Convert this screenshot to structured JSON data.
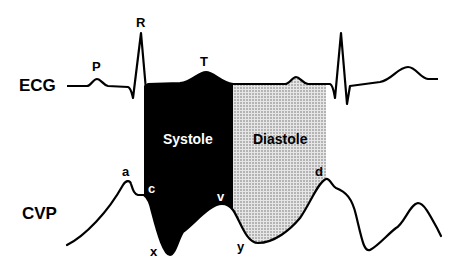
{
  "diagram": {
    "rows": {
      "ecg": "ECG",
      "cvp": "CVP"
    },
    "ecg_waves": {
      "p": "P",
      "r": "R",
      "t": "T"
    },
    "cvp_waves": {
      "a": "a",
      "c": "c",
      "x": "x",
      "v": "v",
      "y": "y",
      "d": "d"
    },
    "phases": {
      "systole": "Systole",
      "diastole": "Diastole"
    },
    "colors": {
      "line": "#000000",
      "systole_fill": "#000000",
      "diastole_fill": "#c8c8c8",
      "background": "#ffffff"
    }
  }
}
